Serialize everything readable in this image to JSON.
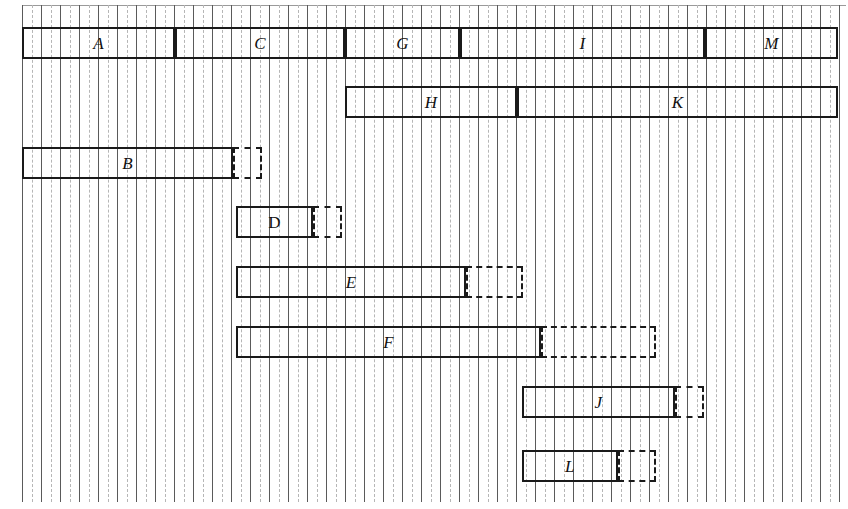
{
  "chart_data": {
    "type": "bar",
    "title": "",
    "subtitle": "",
    "xlabel": "",
    "ylabel": "",
    "orientation": "horizontal",
    "chart_kind": "gantt",
    "grid": {
      "visible": true,
      "major_spacing_px": 19,
      "minor_spacing_px": 9.5,
      "major_color": "#5a5a5a",
      "minor_color": "#b6b6b6",
      "minor_style": "dashed",
      "x_start_px": 22,
      "x_end_px": 846,
      "y_start_px": 5,
      "y_end_px": 502,
      "major_count": 44
    },
    "legend": {
      "visible": false,
      "position": "none"
    },
    "axis_ranges": {
      "x_units": [
        0,
        43
      ]
    },
    "colors": {
      "bar_outline": "#1a1a1a",
      "slack_outline": "#1a1a1a",
      "background": "#ffffff",
      "label": "#111111"
    },
    "rows": [
      {
        "row_index": 0,
        "y_top": 27,
        "height": 32,
        "tasks": [
          {
            "label": "A",
            "x_start": 22,
            "x_end": 175,
            "slack_end": null,
            "label_style": "italic"
          },
          {
            "label": "C",
            "x_start": 175,
            "x_end": 345,
            "slack_end": null,
            "label_style": "italic"
          },
          {
            "label": "G",
            "x_start": 345,
            "x_end": 460,
            "slack_end": null,
            "label_style": "italic"
          },
          {
            "label": "I",
            "x_start": 460,
            "x_end": 705,
            "slack_end": null,
            "label_style": "italic"
          },
          {
            "label": "M",
            "x_start": 705,
            "x_end": 838,
            "slack_end": null,
            "label_style": "italic"
          }
        ]
      },
      {
        "row_index": 1,
        "y_top": 86,
        "height": 32,
        "tasks": [
          {
            "label": "H",
            "x_start": 345,
            "x_end": 517,
            "slack_end": null,
            "label_style": "italic"
          },
          {
            "label": "K",
            "x_start": 517,
            "x_end": 838,
            "slack_end": null,
            "label_style": "italic"
          }
        ]
      },
      {
        "row_index": 2,
        "y_top": 147,
        "height": 32,
        "tasks": [
          {
            "label": "B",
            "x_start": 22,
            "x_end": 233,
            "slack_end": 262,
            "label_style": "italic"
          }
        ]
      },
      {
        "row_index": 3,
        "y_top": 206,
        "height": 32,
        "tasks": [
          {
            "label": "D",
            "x_start": 236,
            "x_end": 313,
            "slack_end": 342,
            "label_style": "upright"
          }
        ]
      },
      {
        "row_index": 4,
        "y_top": 266,
        "height": 32,
        "tasks": [
          {
            "label": "E",
            "x_start": 236,
            "x_end": 466,
            "slack_end": 523,
            "label_style": "italic"
          }
        ]
      },
      {
        "row_index": 5,
        "y_top": 326,
        "height": 32,
        "tasks": [
          {
            "label": "F",
            "x_start": 236,
            "x_end": 541,
            "slack_end": 656,
            "label_style": "italic"
          }
        ]
      },
      {
        "row_index": 6,
        "y_top": 386,
        "height": 32,
        "tasks": [
          {
            "label": "J",
            "x_start": 522,
            "x_end": 675,
            "slack_end": 704,
            "label_style": "italic"
          }
        ]
      },
      {
        "row_index": 7,
        "y_top": 450,
        "height": 32,
        "tasks": [
          {
            "label": "L",
            "x_start": 522,
            "x_end": 618,
            "slack_end": 656,
            "label_style": "italic"
          }
        ]
      }
    ],
    "task_labels": [
      "A",
      "C",
      "G",
      "I",
      "M",
      "H",
      "K",
      "B",
      "D",
      "E",
      "F",
      "J",
      "L"
    ],
    "slack_labels": [
      "B",
      "D",
      "E",
      "F",
      "J",
      "L"
    ]
  }
}
